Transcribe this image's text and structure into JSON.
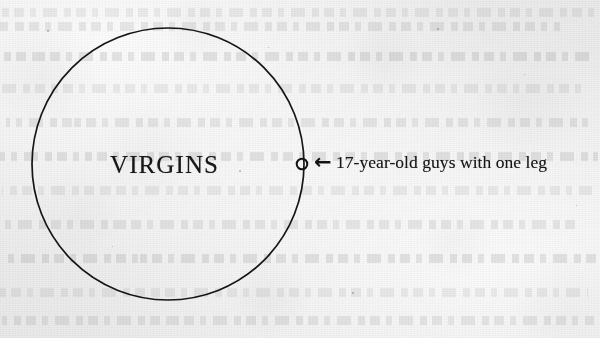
{
  "page": {
    "kind": "scanned-book-page",
    "background_color": "#eeeeef",
    "ink_color": "#181818"
  },
  "diagram": {
    "type": "venn-single-set",
    "set": {
      "label": "VIRGINS",
      "shape": "ellipse",
      "center_x": 168,
      "center_y": 164,
      "radius_x": 136,
      "radius_y": 136,
      "stroke_color": "#15151a",
      "stroke_width": 1.7,
      "fill": "none"
    },
    "subset_marker": {
      "label": "subset-circle",
      "shape": "circle",
      "center_x": 302,
      "center_y": 164,
      "radius": 5.3,
      "stroke_color": "#111115",
      "stroke_width": 2,
      "fill": "none"
    },
    "callout": {
      "arrow_glyph": "←",
      "arrow_name": "left-arrow-icon",
      "text": "17-year-old guys with one leg"
    }
  },
  "ghost_text": {
    "description": "faint show-through text lines from the reverse side of the page",
    "lines": [
      {
        "x": 2,
        "y": 8,
        "width": 596
      },
      {
        "x": 0,
        "y": 22,
        "width": 560
      },
      {
        "x": 4,
        "y": 52,
        "width": 592
      },
      {
        "x": 0,
        "y": 84,
        "width": 586
      },
      {
        "x": 6,
        "y": 118,
        "width": 582
      },
      {
        "x": 0,
        "y": 152,
        "width": 598
      },
      {
        "x": 2,
        "y": 186,
        "width": 590
      },
      {
        "x": 0,
        "y": 220,
        "width": 576
      },
      {
        "x": 4,
        "y": 254,
        "width": 594
      },
      {
        "x": 0,
        "y": 288,
        "width": 588
      },
      {
        "x": 2,
        "y": 316,
        "width": 592
      }
    ]
  },
  "specks": [
    {
      "x": 239,
      "y": 170,
      "size": 2.1
    },
    {
      "x": 47,
      "y": 30,
      "size": 1.5
    },
    {
      "x": 437,
      "y": 28,
      "size": 1.6
    },
    {
      "x": 524,
      "y": 74,
      "size": 1.4
    },
    {
      "x": 112,
      "y": 246,
      "size": 1.3
    },
    {
      "x": 352,
      "y": 292,
      "size": 1.5
    },
    {
      "x": 268,
      "y": 47,
      "size": 1.2
    },
    {
      "x": 576,
      "y": 205,
      "size": 1.4
    }
  ]
}
